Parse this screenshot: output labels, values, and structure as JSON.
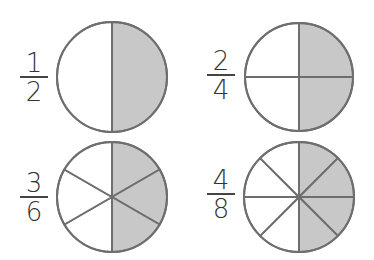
{
  "colors": {
    "shaded": "#c8c8c8",
    "unshaded": "#ffffff",
    "stroke": "#6e6e6e",
    "text": "#333333"
  },
  "fractions": [
    {
      "numerator": "1",
      "denominator": "2",
      "parts": 2,
      "shaded": 1,
      "label_center": [
        34,
        77
      ],
      "circle": {
        "cx": 112,
        "cy": 77,
        "r": 55
      }
    },
    {
      "numerator": "2",
      "denominator": "4",
      "parts": 4,
      "shaded": 2,
      "label_center": [
        221,
        76
      ],
      "circle": {
        "cx": 299,
        "cy": 77,
        "r": 54
      }
    },
    {
      "numerator": "3",
      "denominator": "6",
      "parts": 6,
      "shaded": 3,
      "label_center": [
        34,
        197
      ],
      "circle": {
        "cx": 112,
        "cy": 197,
        "r": 55
      }
    },
    {
      "numerator": "4",
      "denominator": "8",
      "parts": 8,
      "shaded": 4,
      "label_center": [
        221,
        195
      ],
      "circle": {
        "cx": 299,
        "cy": 197,
        "r": 55
      }
    }
  ]
}
